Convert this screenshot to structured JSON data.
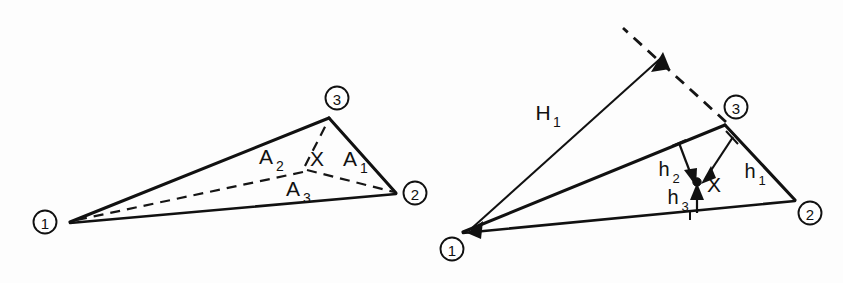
{
  "figure": {
    "background_color": "#fdfdfd",
    "ink_color": "#111111"
  },
  "left_panel": {
    "name": "area-coordinates-diagram",
    "caption": "Subtriangle areas A1, A2, A3 formed by interior point X",
    "vertices": [
      {
        "id": "v1",
        "label": "1",
        "cx": 45,
        "cy": 222,
        "apex_x": 70,
        "apex_y": 222
      },
      {
        "id": "v2",
        "label": "2",
        "cx": 415,
        "cy": 193,
        "apex_x": 396,
        "apex_y": 193
      },
      {
        "id": "v3",
        "label": "3",
        "cx": 337,
        "cy": 98,
        "apex_x": 329,
        "apex_y": 118
      }
    ],
    "interior_point": {
      "label": "X",
      "x": 305,
      "y": 170
    },
    "area_labels": [
      {
        "name": "area-label-a1",
        "base": "A",
        "sub": "1",
        "x": 352,
        "y": 166
      },
      {
        "name": "area-label-a2",
        "base": "A",
        "sub": "2",
        "x": 268,
        "y": 164
      },
      {
        "name": "area-label-a3",
        "base": "A",
        "sub": "3",
        "x": 295,
        "y": 195
      }
    ]
  },
  "right_panel": {
    "name": "height-coordinates-diagram",
    "caption": "Perpendicular heights h1, h2, h3 from point X and total height H1",
    "vertices": [
      {
        "id": "v1",
        "label": "1",
        "cx": 452,
        "cy": 249,
        "apex_x": 463,
        "apex_y": 232
      },
      {
        "id": "v2",
        "label": "2",
        "cx": 810,
        "cy": 213,
        "apex_x": 795,
        "apex_y": 200
      },
      {
        "id": "v3",
        "label": "3",
        "cx": 736,
        "cy": 107,
        "apex_x": 725,
        "apex_y": 125
      }
    ],
    "interior_point": {
      "label": "X",
      "x": 710,
      "y": 190
    },
    "height_labels": [
      {
        "name": "height-label-h1",
        "base": "h",
        "sub": "1",
        "x": 752,
        "y": 178
      },
      {
        "name": "height-label-h2",
        "base": "h",
        "sub": "2",
        "x": 665,
        "y": 175
      },
      {
        "name": "height-label-h3",
        "base": "h",
        "sub": "3",
        "x": 675,
        "y": 203
      }
    ],
    "total_height_label": {
      "name": "total-height-label-H1",
      "base": "H",
      "sub": "1",
      "x": 545,
      "y": 120
    }
  }
}
